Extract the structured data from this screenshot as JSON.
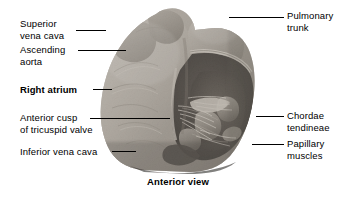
{
  "figure": {
    "caption": "Anterior view",
    "caption_position": {
      "top": 176
    },
    "background_color": "#ffffff",
    "text_color": "#000000",
    "leader_color": "#000000"
  },
  "labels": {
    "left": [
      {
        "name": "superior-vena-cava",
        "lines": [
          "Superior",
          "vena cava"
        ],
        "text": "Superior\nvena cava",
        "x": 20,
        "y": 18,
        "bold": false,
        "leader": {
          "x1": 76,
          "y1": 30,
          "x2": 106,
          "y2": 30
        }
      },
      {
        "name": "ascending-aorta",
        "lines": [
          "Ascending",
          "aorta"
        ],
        "text": "Ascending\naorta",
        "x": 20,
        "y": 44,
        "bold": false,
        "leader": {
          "x1": 78,
          "y1": 50,
          "x2": 126,
          "y2": 50
        }
      },
      {
        "name": "right-atrium",
        "lines": [
          "Right atrium"
        ],
        "text": "Right atrium",
        "x": 20,
        "y": 84,
        "bold": true,
        "leader": {
          "x1": 93,
          "y1": 89,
          "x2": 112,
          "y2": 89
        }
      },
      {
        "name": "anterior-cusp-of-tricuspid-valve",
        "lines": [
          "Anterior cusp",
          "of tricuspid valve"
        ],
        "text": "Anterior cusp\nof tricuspid valve",
        "x": 20,
        "y": 112,
        "bold": false,
        "leader": {
          "x1": 90,
          "y1": 118,
          "x2": 170,
          "y2": 118
        }
      },
      {
        "name": "inferior-vena-cava",
        "lines": [
          "Inferior vena cava"
        ],
        "text": "Inferior vena cava",
        "x": 20,
        "y": 146,
        "bold": false,
        "leader": {
          "x1": 112,
          "y1": 151,
          "x2": 136,
          "y2": 151
        }
      }
    ],
    "right": [
      {
        "name": "pulmonary-trunk",
        "lines": [
          "Pulmonary",
          "trunk"
        ],
        "text": "Pulmonary\ntrunk",
        "x": 287,
        "y": 10,
        "bold": false,
        "leader": {
          "x1": 229,
          "y1": 17,
          "x2": 284,
          "y2": 17
        }
      },
      {
        "name": "chordae-tendineae",
        "lines": [
          "Chordae",
          "tendineae"
        ],
        "text": "Chordae\ntendineae",
        "x": 287,
        "y": 110,
        "bold": false,
        "leader": {
          "x1": 256,
          "y1": 116,
          "x2": 284,
          "y2": 116
        }
      },
      {
        "name": "papillary-muscles",
        "lines": [
          "Papillary",
          "muscles"
        ],
        "text": "Papillary\nmuscles",
        "x": 287,
        "y": 138,
        "bold": false,
        "leader": {
          "x1": 252,
          "y1": 144,
          "x2": 284,
          "y2": 144
        }
      }
    ]
  }
}
